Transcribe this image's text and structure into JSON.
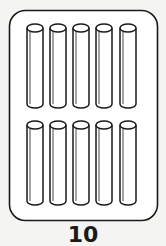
{
  "card": {
    "title": "10",
    "count": 10,
    "rows": 2,
    "per_row": 5,
    "item": "cylinder",
    "stroke_color": "#1a1a1a",
    "fill_color": "#ffffff",
    "background_color": "#f4f4f2"
  }
}
